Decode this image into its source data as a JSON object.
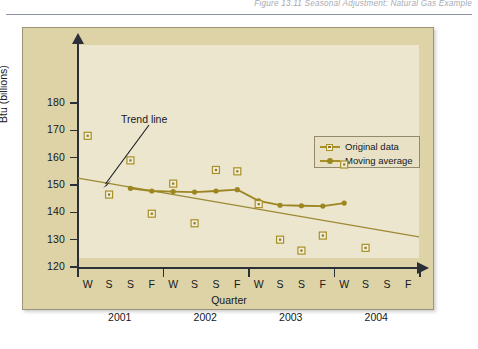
{
  "header": {
    "title": "Figure 13.11  Seasonal Adjustment: Natural Gas Example"
  },
  "annotations": {
    "trend_line_label": "Trend line"
  },
  "legend": {
    "position": "inside-top-right",
    "entries": [
      {
        "label": "Original data",
        "marker": "square",
        "color": "#a89028"
      },
      {
        "label": "Moving average",
        "marker": "circle",
        "color": "#9c8622"
      }
    ]
  },
  "colors": {
    "figure_background": "#ddd3a6",
    "plot_background": "#ece6cf",
    "axis": "#2b2f38",
    "original_data": "#a89028",
    "moving_average": "#9c8622",
    "trend_line": "#9c8a33",
    "text": "#15181d"
  },
  "chart_data": {
    "type": "line",
    "title": "",
    "xlabel": "Quarter",
    "ylabel": "Btu (billions)",
    "ylim": [
      120,
      180
    ],
    "yticks": [
      120,
      130,
      140,
      150,
      160,
      170,
      180
    ],
    "grid": false,
    "x": [
      "W",
      "S",
      "S",
      "F",
      "W",
      "S",
      "S",
      "F",
      "W",
      "S",
      "S",
      "F",
      "W",
      "S",
      "S",
      "F"
    ],
    "year_groups": [
      {
        "label": "2001",
        "quarters": [
          "W",
          "S",
          "S",
          "F"
        ]
      },
      {
        "label": "2002",
        "quarters": [
          "W",
          "S",
          "S",
          "F"
        ]
      },
      {
        "label": "2003",
        "quarters": [
          "W",
          "S",
          "S",
          "F"
        ]
      },
      {
        "label": "2004",
        "quarters": [
          "W",
          "S",
          "S",
          "F"
        ]
      }
    ],
    "series": [
      {
        "name": "Original data",
        "marker": "square",
        "color": "#a89028",
        "line": false,
        "values": [
          168,
          146.5,
          159,
          139.5,
          150.5,
          136,
          155.5,
          155,
          143,
          130,
          126,
          131.5,
          157.5,
          127,
          null,
          null
        ]
      },
      {
        "name": "Moving average",
        "marker": "circle",
        "color": "#9c8622",
        "line": true,
        "values": [
          null,
          null,
          148.8,
          147.8,
          147.6,
          147.4,
          147.8,
          148.3,
          144.2,
          142.6,
          142.4,
          142.3,
          143.4,
          null,
          null,
          null
        ]
      },
      {
        "name": "Trend line",
        "marker": "none",
        "color": "#9c8a33",
        "line": true,
        "endpoints": [
          {
            "x": "start",
            "y": 152.5
          },
          {
            "x": "end",
            "y": 131.0
          }
        ]
      }
    ]
  }
}
